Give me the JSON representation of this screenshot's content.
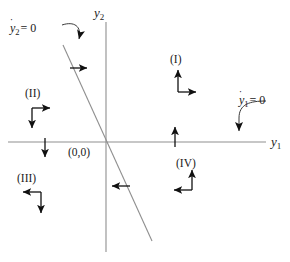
{
  "figure": {
    "type": "phase-plane-diagram",
    "width": 290,
    "height": 262,
    "background_color": "#ffffff",
    "line_color": "#8a8a8a",
    "arrow_color": "#111111",
    "text_color": "#1a1a1a"
  },
  "axes": {
    "vertical": {
      "name": "y2-axis",
      "label": "y",
      "subscript": "2",
      "x": 106,
      "y_top": 22,
      "y_bottom": 252
    },
    "horizontal": {
      "name": "y1-axis",
      "label": "y",
      "subscript": "1",
      "y": 142,
      "x_left": 8,
      "x_right": 266
    },
    "origin_label": "(0,0)"
  },
  "nullclines": [
    {
      "name": "y2dot-nullcline",
      "label_prefix": "y",
      "label_subscript": "2",
      "label_suffix": "= 0",
      "label_full": "y2 = 0",
      "accent": "dot",
      "x1": 63,
      "y1": 45,
      "x2": 152,
      "y2": 241
    },
    {
      "name": "y1dot-nullcline",
      "label_prefix": "y",
      "label_subscript": "1",
      "label_suffix": "= 0",
      "label_full": "y1 = 0",
      "accent": "dot",
      "points_to": "horizontal-axis"
    }
  ],
  "quadrants": [
    {
      "id": "I",
      "label": "(I)",
      "arrows": [
        "up",
        "right"
      ]
    },
    {
      "id": "II",
      "label": "(II)",
      "arrows": [
        "right",
        "down"
      ]
    },
    {
      "id": "III",
      "label": "(III)",
      "arrows": [
        "left",
        "down"
      ]
    },
    {
      "id": "IV",
      "label": "(IV)",
      "arrows": [
        "left",
        "up"
      ]
    }
  ],
  "direction_markers": [
    {
      "name": "arrow-right-upper-left",
      "direction": "right",
      "x": 86,
      "y": 68
    },
    {
      "name": "arrow-left-lower-right",
      "direction": "left",
      "x": 112,
      "y": 186
    },
    {
      "name": "arrow-down-left-axis",
      "direction": "down",
      "x": 45,
      "y": 155
    },
    {
      "name": "arrow-up-right-axis",
      "direction": "up",
      "x": 175,
      "y": 130
    }
  ]
}
